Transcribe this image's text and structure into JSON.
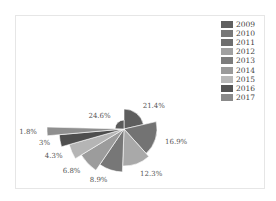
{
  "chart_data": {
    "type": "pie",
    "subtype": "nightingale-rose",
    "title": "",
    "categories": [
      "2009",
      "2010",
      "2011",
      "2012",
      "2013",
      "2014",
      "2015",
      "2016",
      "2017"
    ],
    "values": [
      21.4,
      16.9,
      12.3,
      8.9,
      6.8,
      4.3,
      3.0,
      1.8,
      24.6
    ],
    "labels": [
      "21.4%",
      "16.9%",
      "12.3%",
      "8.9%",
      "6.8%",
      "4.3%",
      "3%",
      "1.8%",
      "24.6%"
    ],
    "radii_px": [
      20,
      33,
      37,
      43,
      50,
      57,
      65,
      77,
      9
    ],
    "slice_colors": [
      "#5e5e5e",
      "#737373",
      "#a9a9a9",
      "#777777",
      "#9c9c9c",
      "#b5b5b5",
      "#4e4e4e",
      "#8f8f8f",
      "#5a5a5a"
    ],
    "legend": {
      "position": "top-right",
      "entries": [
        {
          "label": "2009",
          "color": "#606060"
        },
        {
          "label": "2010",
          "color": "#787878"
        },
        {
          "label": "2011",
          "color": "#6e6e6e"
        },
        {
          "label": "2012",
          "color": "#a0a0a0"
        },
        {
          "label": "2013",
          "color": "#7c7c7c"
        },
        {
          "label": "2014",
          "color": "#9a9a9a"
        },
        {
          "label": "2015",
          "color": "#b8b8b8"
        },
        {
          "label": "2016",
          "color": "#555555"
        },
        {
          "label": "2017",
          "color": "#8a8a8a"
        }
      ]
    },
    "center_px": [
      124,
      129
    ],
    "start_angle_deg": 0,
    "direction": "clockwise"
  }
}
